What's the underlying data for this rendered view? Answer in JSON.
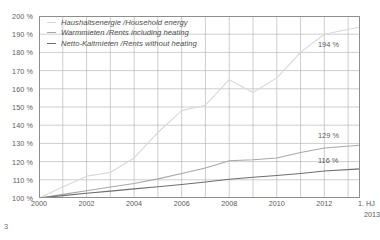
{
  "page": {
    "number": "3"
  },
  "legend": [
    {
      "label": "Haushaltsenergie /Household energy",
      "color": "#d8d8d8"
    },
    {
      "label": "Warmmieten /Rents including heating",
      "color": "#a8a8a8"
    },
    {
      "label": "Netto-Kaltmieten /Rents without heating",
      "color": "#6e6e6e"
    }
  ],
  "callouts": [
    {
      "text": "194 %",
      "x": 318,
      "y": 40
    },
    {
      "text": "129 %",
      "x": 318,
      "y": 131
    },
    {
      "text": "116 %",
      "x": 318,
      "y": 156
    }
  ],
  "axis": {
    "x_last_top": "1. HJ",
    "x_last_bottom": "2013"
  },
  "chart_data": {
    "type": "line",
    "title": "",
    "subtitle": "",
    "xlabel": "",
    "ylabel": "",
    "grid": true,
    "legend_position": "top-left-inside",
    "ylim": [
      100,
      200
    ],
    "yticks": [
      100,
      110,
      120,
      130,
      140,
      150,
      160,
      170,
      180,
      190,
      200
    ],
    "ytick_labels": [
      "100 %",
      "110 %",
      "120 %",
      "130 %",
      "140 %",
      "150 %",
      "160 %",
      "170 %",
      "180 %",
      "190 %",
      "200 %"
    ],
    "xlim": [
      2000,
      2013.5
    ],
    "xticks": [
      2000,
      2002,
      2004,
      2006,
      2008,
      2010,
      2012,
      2013.5
    ],
    "xtick_labels": [
      "2000",
      "2002",
      "2004",
      "2006",
      "2008",
      "2010",
      "2012",
      "1. HJ 2013"
    ],
    "x_gridlines": [
      2000,
      2001,
      2002,
      2003,
      2004,
      2005,
      2006,
      2007,
      2008,
      2009,
      2010,
      2011,
      2012,
      2013
    ],
    "x": [
      2000,
      2001,
      2002,
      2003,
      2004,
      2005,
      2006,
      2007,
      2008,
      2009,
      2010,
      2011,
      2012,
      2013.5
    ],
    "series": [
      {
        "name": "Haushaltsenergie /Household energy",
        "color": "#d8d8d8",
        "end_label": "194 %",
        "values": [
          100,
          106,
          112,
          114,
          122,
          136,
          148,
          151,
          165,
          158,
          166,
          180,
          190,
          194
        ]
      },
      {
        "name": "Warmmieten /Rents including heating",
        "color": "#a8a8a8",
        "end_label": "129 %",
        "values": [
          100,
          102,
          104,
          106,
          108,
          110.5,
          113.5,
          116.5,
          120.5,
          121,
          122,
          125,
          127.5,
          129
        ]
      },
      {
        "name": "Netto-Kaltmieten /Rents without heating",
        "color": "#6e6e6e",
        "end_label": "116 %",
        "values": [
          100,
          101.3,
          102.6,
          103.8,
          105,
          106.2,
          107.4,
          108.8,
          110.3,
          111.4,
          112.4,
          113.5,
          114.8,
          116
        ]
      }
    ]
  }
}
